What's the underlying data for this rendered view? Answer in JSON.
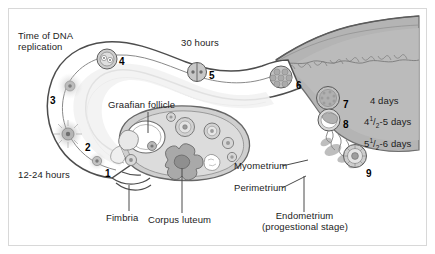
{
  "figure": {
    "frame_color": "#d8d8d8",
    "ink_color": "#1c1c1c"
  },
  "labels": {
    "dna_replication_line1": "Time of DNA",
    "dna_replication_line2": "replication",
    "thirty_hours": "30 hours",
    "twelve_24_hours": "12-24 hours",
    "graafian_follicle": "Graafian follicle",
    "corpus_luteum": "Corpus luteum",
    "fimbria": "Fimbria",
    "myometrium": "Myometrium",
    "perimetrium": "Perimetrium",
    "endometrium_line1": "Endometrium",
    "endometrium_line2": "(progestional stage)",
    "four_days": "4 days",
    "four_half_five_days": {
      "whole": "4",
      "num": "1",
      "slash": "/",
      "den": "2",
      "tail": "-5 days"
    },
    "five_half_six_days": {
      "whole": "5",
      "num": "1",
      "slash": "/",
      "den": "2",
      "tail": "-6 days"
    }
  },
  "stages": [
    {
      "id": "1",
      "number": "1",
      "x": 105,
      "y": 169,
      "desc": "ovulated oocyte at fimbria"
    },
    {
      "id": "2",
      "number": "2",
      "x": 85,
      "y": 143,
      "desc": "oocyte with corona radiata"
    },
    {
      "id": "3",
      "number": "3",
      "x": 50,
      "y": 96,
      "desc": "oocyte in ampulla"
    },
    {
      "id": "4",
      "number": "4",
      "x": 119,
      "y": 57,
      "desc": "fertilized zygote, pronuclei"
    },
    {
      "id": "5",
      "number": "5",
      "x": 209,
      "y": 71,
      "desc": "two-cell stage"
    },
    {
      "id": "6",
      "number": "6",
      "x": 296,
      "y": 81,
      "desc": "morula"
    },
    {
      "id": "7",
      "number": "7",
      "x": 343,
      "y": 100,
      "desc": "blastocyst"
    },
    {
      "id": "8",
      "number": "8",
      "x": 343,
      "y": 120,
      "desc": "free blastocyst in uterus"
    },
    {
      "id": "9",
      "number": "9",
      "x": 366,
      "y": 169,
      "desc": "implanting blastocyst"
    }
  ]
}
